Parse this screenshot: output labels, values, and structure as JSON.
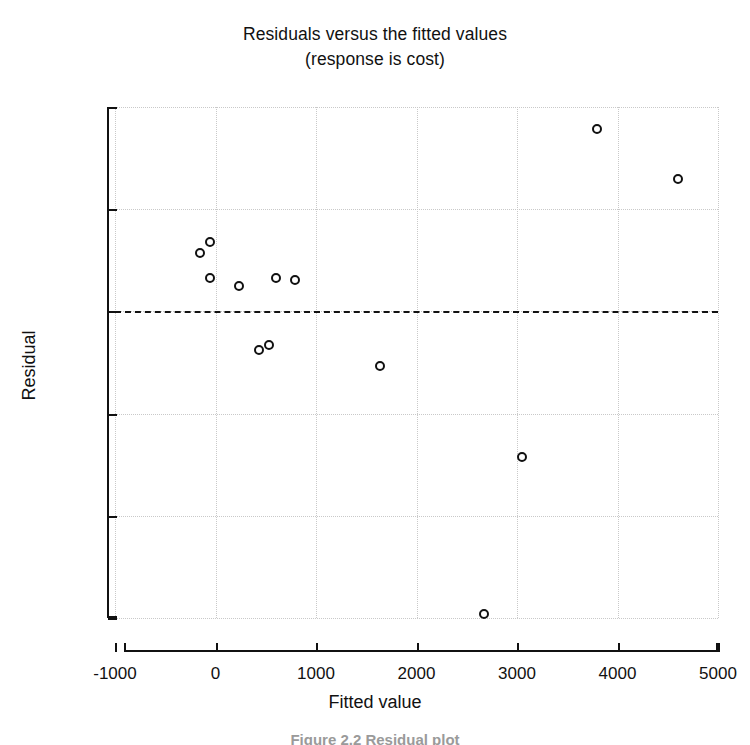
{
  "chart_data": {
    "type": "scatter",
    "title": "Residuals versus the fitted values",
    "subtitle": "(response is cost)",
    "xlabel": "Fitted value",
    "ylabel": "Residual",
    "xlim": [
      -1000,
      5000
    ],
    "ylim": [
      -1500,
      1000
    ],
    "xticks": [
      "-1000",
      "0",
      "1000",
      "2000",
      "3000",
      "4000",
      "5000"
    ],
    "xtick_values": [
      -1000,
      0,
      1000,
      2000,
      3000,
      4000,
      5000
    ],
    "yticks": [
      "1000",
      "500",
      "0",
      "-500",
      "-1000",
      "-1500"
    ],
    "ytick_values": [
      1000,
      500,
      0,
      -500,
      -1000,
      -1500
    ],
    "grid": true,
    "grid_style": "dotted",
    "reference_line": {
      "y": 0,
      "style": "dashed",
      "color": "#111111"
    },
    "marker": {
      "shape": "open-circle",
      "size": 10,
      "color": "#111111"
    },
    "legend": null,
    "points": [
      {
        "x": -150,
        "y": 285
      },
      {
        "x": -50,
        "y": 340
      },
      {
        "x": -50,
        "y": 165
      },
      {
        "x": 230,
        "y": 125
      },
      {
        "x": 600,
        "y": 165
      },
      {
        "x": 790,
        "y": 155
      },
      {
        "x": 430,
        "y": -190
      },
      {
        "x": 530,
        "y": -165
      },
      {
        "x": 1640,
        "y": -265
      },
      {
        "x": 2670,
        "y": -1480
      },
      {
        "x": 3050,
        "y": -710
      },
      {
        "x": 3800,
        "y": 890
      },
      {
        "x": 4600,
        "y": 650
      }
    ]
  },
  "caption": "Figure 2.2  Residual plot"
}
